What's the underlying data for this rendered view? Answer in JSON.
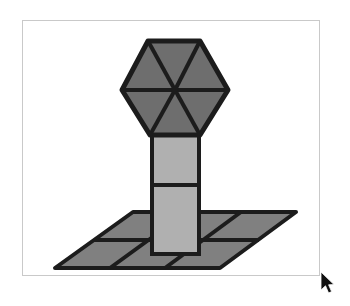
{
  "app": {
    "title": "Shape Viewer",
    "background_color": "#ffffff"
  },
  "canvas": {
    "name": "drawing-canvas",
    "frame_color": "#c9c9c9",
    "fill_color": "#ffffff",
    "x": 22,
    "y": 20,
    "width": 298,
    "height": 256
  },
  "palette": {
    "outline": "#1c1c1c",
    "hexagon_fill": "#6e6e6e",
    "column_fill": "#b0b0b0",
    "floor_fill": "#808080"
  },
  "scene": {
    "name": "isometric-block-scene",
    "description": "Hexagonal prism head on a two-segment column standing on a tiled ground plane",
    "parts": [
      {
        "id": "hexagon-head",
        "label": "Hexagon head",
        "fill": "#6e6e6e",
        "segments": 6,
        "points": "148,41 200,41 228,90 200,135 150,135 122,90"
      },
      {
        "id": "column-upper",
        "label": "Upper column block",
        "fill": "#b0b0b0",
        "points": "152,135 199,135 199,185 152,185"
      },
      {
        "id": "column-lower",
        "label": "Lower column block",
        "fill": "#b0b0b0",
        "points": "152,185 199,185 199,254 152,254"
      },
      {
        "id": "ground-plane",
        "label": "Tiled ground plane",
        "fill": "#808080",
        "points": "133,212 296,212 220,268 55,268",
        "columns": 3,
        "rows": 2
      }
    ],
    "hexagon_spokes": [
      "175,90 148,41",
      "175,90 200,41",
      "175,90 228,90",
      "175,90 200,135",
      "175,90 150,135",
      "175,90 122,90"
    ],
    "floor_lines": [
      "187,212 110,268",
      "241,212 165,268",
      "94,240 259,240"
    ]
  },
  "cursor": {
    "name": "mouse-pointer",
    "x": 320,
    "y": 272,
    "color": "#000000"
  }
}
